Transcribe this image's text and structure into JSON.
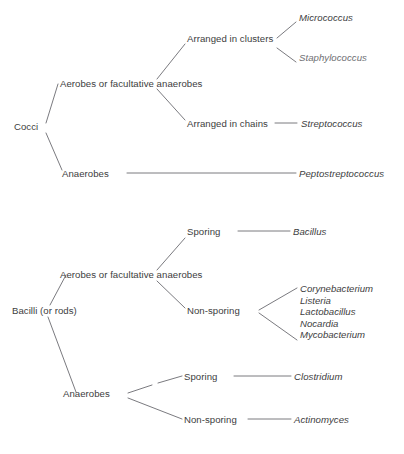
{
  "diagram": {
    "line_color": "#6b6b70",
    "text_color": "#3d3d40",
    "sections": [
      {
        "name": "cocci",
        "root": "Cocci",
        "nodes": {
          "aerobes": "Aerobes or facultative anaerobes",
          "anaerobes": "Anaerobes",
          "clusters": "Arranged in clusters",
          "chains": "Arranged in chains"
        },
        "taxa": {
          "micrococcus": "Micrococcus",
          "staphylococcus": "Staphylococcus",
          "streptococcus": "Streptococcus",
          "peptostreptococcus": "Peptostreptococcus"
        }
      },
      {
        "name": "bacilli",
        "root": "Bacilli (or rods)",
        "nodes": {
          "aerobes": "Aerobes or facultative anaerobes",
          "anaerobes": "Anaerobes",
          "sporing_aerobic": "Sporing",
          "nonsporing_aerobic": "Non-sporing",
          "sporing_anaerobic": "Sporing",
          "nonsporing_anaerobic": "Non-sporing"
        },
        "taxa": {
          "bacillus": "Bacillus",
          "clostridium": "Clostridium",
          "actinomyces": "Actinomyces",
          "nonsporing_list": [
            "Corynebacterium",
            "Listeria",
            "Lactobacillus",
            "Nocardia",
            "Mycobacterium"
          ]
        }
      }
    ]
  }
}
